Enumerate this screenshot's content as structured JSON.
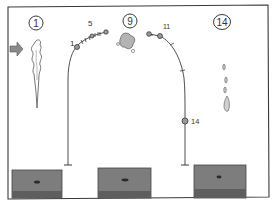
{
  "panels": [
    {
      "id": "panel-1",
      "step_label": "1"
    },
    {
      "id": "panel-9",
      "step_label": "9"
    },
    {
      "id": "panel-14",
      "step_label": "14"
    }
  ],
  "trajectory_left": {
    "start_label": "1",
    "mid_label": "5"
  },
  "trajectory_right": {
    "start_label": "11",
    "end_label": "14"
  },
  "icons": {
    "arrow": "arrow-right-icon",
    "plume_left": "smoke-plume-icon",
    "cloud_center": "cloud-puff-icon",
    "droplets_right": "droplets-icon"
  },
  "colors": {
    "ink": "#3a3a3a",
    "box_fill": "#7d7d7d",
    "box_base": "#5e5e5e",
    "point_fill": "#9a9a9a",
    "arrow_fill": "#8a8a8a",
    "background": "#ffffff"
  }
}
